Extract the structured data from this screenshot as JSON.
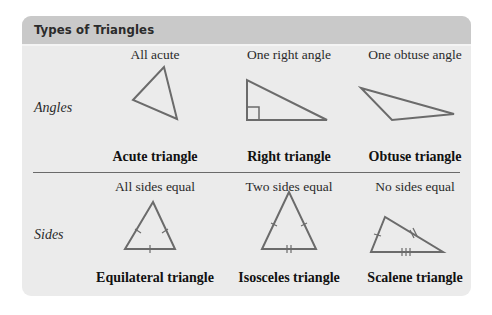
{
  "header": {
    "title": "Types of Triangles"
  },
  "rows": [
    {
      "label": "Angles",
      "items": [
        {
          "caption": "All acute",
          "name": "Acute triangle",
          "icon": "acute-triangle-icon"
        },
        {
          "caption": "One right angle",
          "name": "Right triangle",
          "icon": "right-triangle-icon"
        },
        {
          "caption": "One obtuse angle",
          "name": "Obtuse triangle",
          "icon": "obtuse-triangle-icon"
        }
      ]
    },
    {
      "label": "Sides",
      "items": [
        {
          "caption": "All sides equal",
          "name": "Equilateral triangle",
          "icon": "equilateral-triangle-icon"
        },
        {
          "caption": "Two sides equal",
          "name": "Isosceles triangle",
          "icon": "isosceles-triangle-icon"
        },
        {
          "caption": "No sides equal",
          "name": "Scalene triangle",
          "icon": "scalene-triangle-icon"
        }
      ]
    }
  ],
  "colors": {
    "header_bg": "#c9c9c9",
    "card_bg": "#ebebeb",
    "stroke": "#6b6b6b"
  }
}
